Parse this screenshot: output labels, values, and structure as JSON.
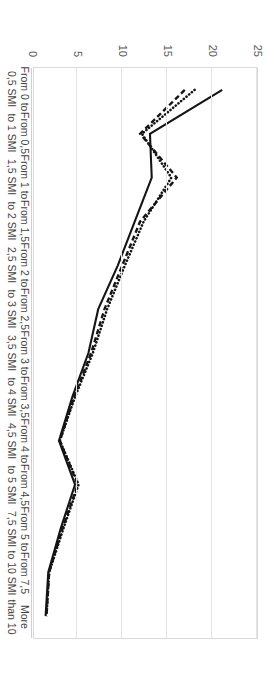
{
  "chart_data": {
    "type": "line",
    "title": "",
    "subtitle": "",
    "xlabel": "",
    "ylabel": "",
    "ylim": [
      0,
      25
    ],
    "yticks": [
      0,
      5,
      10,
      15,
      20,
      25
    ],
    "grid": true,
    "legend": "none",
    "orientation": "rotated-90-clockwise",
    "categories": [
      "From 0 to 0,5 SMI",
      "From 0,5 to 1 SMI",
      "From 1 to 1,5 SMI",
      "From 1,5 to 2 SMI",
      "From 2 to 2,5 SMI",
      "From 2,5 to 3 SMI",
      "From 3 to 3,5 SMI",
      "From 3,5 to 4 SMI",
      "From 4 to 4,5 SMI",
      "From 4,5 to 5 SMI",
      "From 5 to 7,5 SMI",
      "From 7,5 to 10 SMI",
      "More than 10"
    ],
    "category_lines": [
      [
        "From 0 to",
        "0,5 SMI"
      ],
      [
        "From 0,5",
        "to 1 SMI"
      ],
      [
        "From 1 to",
        "1,5 SMI"
      ],
      [
        "From 1,5",
        "to 2 SMI"
      ],
      [
        "From 2 to",
        "2,5 SMI"
      ],
      [
        "From 2,5",
        "to 3 SMI"
      ],
      [
        "From 3 to",
        "3,5 SMI"
      ],
      [
        "From 3,5",
        "to 4 SMI"
      ],
      [
        "From 4 to",
        "4,5 SMI"
      ],
      [
        "From 4,5",
        "to 5 SMI"
      ],
      [
        "From 5 to",
        "7,5 SMI"
      ],
      [
        "From 7,5",
        "to 10 SMI"
      ],
      [
        "More",
        "than 10"
      ]
    ],
    "series": [
      {
        "name": "series-solid",
        "style": "solid",
        "color": "#141414",
        "values": [
          21.1,
          13.0,
          13.2,
          11.3,
          9.4,
          7.2,
          6.1,
          4.3,
          2.8,
          4.6,
          3.0,
          1.6,
          1.3
        ]
      },
      {
        "name": "series-dotted",
        "style": "dotted",
        "color": "#141414",
        "values": [
          18.0,
          12.1,
          15.4,
          12.3,
          10.2,
          8.2,
          6.6,
          4.6,
          2.9,
          5.0,
          3.3,
          1.7,
          1.4
        ]
      },
      {
        "name": "series-dashed",
        "style": "dashed",
        "color": "#141414",
        "values": [
          16.9,
          11.9,
          16.0,
          11.9,
          9.9,
          7.9,
          6.4,
          4.5,
          2.9,
          4.9,
          3.2,
          1.7,
          1.4
        ]
      }
    ]
  },
  "axis": {
    "value_tick_labels": [
      "0",
      "5",
      "10",
      "15",
      "20",
      "25"
    ]
  },
  "colors": {
    "line": "#141414",
    "gridline": "#e4e4e4",
    "plot_border": "#d9d9d9",
    "tick_text": "#595959",
    "category_text": "#3f3f3f",
    "background": "#ffffff"
  }
}
